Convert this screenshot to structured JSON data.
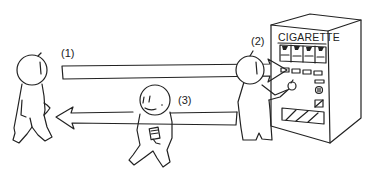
{
  "figure": {
    "steps": [
      {
        "label": "(1)",
        "action": "walk to vending machine",
        "arrow_direction": "right"
      },
      {
        "label": "(2)",
        "action": "buy at vending machine"
      },
      {
        "label": "(3)",
        "action": "walk back holding pack",
        "arrow_direction": "left"
      }
    ],
    "vending_machine": {
      "sign_text": "CIGARETTE"
    },
    "colors": {
      "line": "#222222",
      "background": "#ffffff"
    }
  }
}
